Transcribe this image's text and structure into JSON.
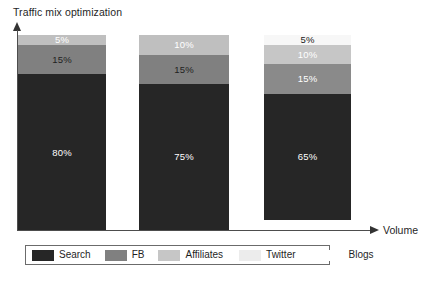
{
  "chart_data": {
    "type": "bar",
    "title": "Traffic mix optimization",
    "subtitle": "",
    "xlabel": "Volume",
    "ylabel": "",
    "stacked": true,
    "normalized_percent": true,
    "grid": false,
    "legend_position": "bottom",
    "axis_style": "arrow-axes-no-ticks",
    "categories": [
      "Bar 1",
      "Bar 2",
      "Bar 3"
    ],
    "xtick_labels": [],
    "ytick_labels": [],
    "ylim": [
      0,
      100
    ],
    "series": [
      {
        "name": "Search",
        "color": "#262626",
        "values": [
          80,
          75,
          65
        ]
      },
      {
        "name": "FB",
        "color": "#808080",
        "values": [
          15,
          15,
          15
        ]
      },
      {
        "name": "Affiliates",
        "color": "#bfbfbf",
        "values": [
          5,
          10,
          10
        ]
      },
      {
        "name": "Twitter",
        "color": "#f2f2f2",
        "values": [
          0,
          0,
          5
        ]
      },
      {
        "name": "Blogs",
        "color": "#ffffff",
        "values": [
          0,
          0,
          0
        ]
      }
    ],
    "bars": [
      {
        "name": "bar-1",
        "segments": [
          {
            "series": "Affiliates",
            "value": 5,
            "label": "5%",
            "color": "#bfbfbf",
            "label_color": "light"
          },
          {
            "series": "FB",
            "value": 15,
            "label": "15%",
            "color": "#808080",
            "label_color": "dark"
          },
          {
            "series": "Search",
            "value": 80,
            "label": "80%",
            "color": "#262626",
            "label_color": "light"
          }
        ]
      },
      {
        "name": "bar-2",
        "segments": [
          {
            "series": "Affiliates",
            "value": 10,
            "label": "10%",
            "color": "#bfbfbf",
            "label_color": "light"
          },
          {
            "series": "FB",
            "value": 15,
            "label": "15%",
            "color": "#808080",
            "label_color": "dark"
          },
          {
            "series": "Search",
            "value": 75,
            "label": "75%",
            "color": "#262626",
            "label_color": "light"
          }
        ]
      },
      {
        "name": "bar-3",
        "segments": [
          {
            "series": "Twitter",
            "value": 5,
            "label": "5%",
            "color": "#f7f7f7",
            "label_color": "dark"
          },
          {
            "series": "Affiliates",
            "value": 10,
            "label": "10%",
            "color": "#c6c6c6",
            "label_color": "light"
          },
          {
            "series": "FB",
            "value": 15,
            "label": "15%",
            "color": "#8a8a8a",
            "label_color": "light"
          },
          {
            "series": "Search",
            "value": 65,
            "label": "65%",
            "color": "#262626",
            "label_color": "light"
          }
        ]
      }
    ]
  },
  "legend": {
    "items": [
      {
        "label": "Search",
        "color": "#262626",
        "swatch_border": "none"
      },
      {
        "label": "FB",
        "color": "#808080",
        "swatch_border": "none"
      },
      {
        "label": "Affiliates",
        "color": "#c6c6c6",
        "swatch_border": "none"
      },
      {
        "label": "Twitter",
        "color": "#ececec",
        "swatch_border": "none"
      },
      {
        "label": "Blogs",
        "color": "#ffffff",
        "swatch_border": "none"
      }
    ]
  },
  "layout": {
    "bar_geometry": [
      {
        "left": 18,
        "width": 88
      },
      {
        "left": 139,
        "width": 90
      },
      {
        "left": 264,
        "width": 87
      }
    ],
    "baseline_y": 230,
    "plot_top_y": 30,
    "bar_full_height": 195
  }
}
